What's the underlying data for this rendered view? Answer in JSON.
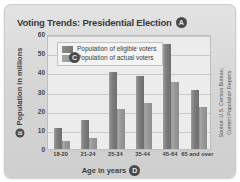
{
  "chart_data": {
    "type": "bar",
    "title": "Voting Trends: Presidential Election",
    "title_badge": "A",
    "xlabel": "Age in years",
    "xlabel_badge": "D",
    "ylabel": "Population in millions",
    "ylabel_badge": "B",
    "plot_badge": "C",
    "categories": [
      "18-20",
      "21-24",
      "25-34",
      "35-44",
      "45-64",
      "65 and over"
    ],
    "series": [
      {
        "name": "Population of eligible voters",
        "values": [
          11,
          15,
          40,
          38,
          55,
          31
        ],
        "color": "#7b7b7b"
      },
      {
        "name": "Population of actual voters",
        "values": [
          4,
          6,
          21,
          24,
          35,
          22
        ],
        "color": "#989898"
      }
    ],
    "ylim": [
      0,
      60
    ],
    "yticks": [
      0,
      10,
      20,
      30,
      40,
      50,
      60
    ],
    "grid": true,
    "legend_position": "top-left-inside",
    "source": "Source: U.S. Census Bureau,\nCurrent Population Reports",
    "source_line1": "Source: U.S. Census Bureau,",
    "source_line2": "Current Population Reports"
  },
  "theme": {
    "card_bg": "#d9d9d9",
    "plot_bg": "#ececec",
    "grid_color": "#c9c9c9",
    "text_color": "#3f3f3f",
    "badge_bg": "#4a4a4a"
  }
}
